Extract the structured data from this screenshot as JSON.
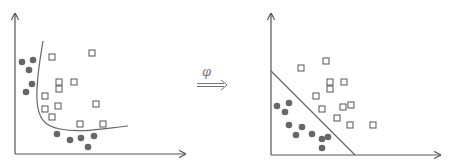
{
  "diagram": {
    "mapping_label": "φ",
    "colors": {
      "axis": "#555555",
      "circle": "#666666",
      "square_stroke": "#555555",
      "boundary": "#666666"
    },
    "left_plot": {
      "title": "input space (nonlinear boundary)",
      "circles": [
        [
          22,
          62
        ],
        [
          33,
          60
        ],
        [
          29,
          70
        ],
        [
          32,
          84
        ],
        [
          26,
          92
        ],
        [
          57,
          134
        ],
        [
          70,
          140
        ],
        [
          81,
          138
        ],
        [
          94,
          136
        ],
        [
          88,
          147
        ]
      ],
      "squares": [
        [
          52,
          57
        ],
        [
          92,
          53
        ],
        [
          59,
          82
        ],
        [
          74,
          82
        ],
        [
          59,
          89
        ],
        [
          45,
          96
        ],
        [
          58,
          106
        ],
        [
          45,
          109
        ],
        [
          96,
          104
        ],
        [
          52,
          117
        ],
        [
          80,
          124
        ],
        [
          103,
          124
        ]
      ]
    },
    "right_plot": {
      "title": "feature space (linear boundary)",
      "circles": [
        [
          277,
          106
        ],
        [
          289,
          103
        ],
        [
          285,
          112
        ],
        [
          289,
          125
        ],
        [
          302,
          127
        ],
        [
          296,
          135
        ],
        [
          312,
          134
        ],
        [
          322,
          139
        ],
        [
          328,
          137
        ],
        [
          322,
          148
        ]
      ],
      "squares": [
        [
          326,
          61
        ],
        [
          301,
          68
        ],
        [
          330,
          82
        ],
        [
          344,
          82
        ],
        [
          330,
          89
        ],
        [
          316,
          96
        ],
        [
          322,
          109
        ],
        [
          343,
          107
        ],
        [
          351,
          105
        ],
        [
          337,
          118
        ],
        [
          350,
          125
        ],
        [
          373,
          125
        ]
      ]
    }
  }
}
